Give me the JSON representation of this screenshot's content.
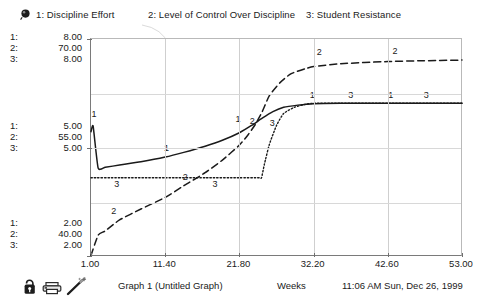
{
  "legend": {
    "pin_icon": "pushpin-icon",
    "items": [
      {
        "key": "1",
        "label": "1: Discipline Effort"
      },
      {
        "key": "2",
        "label": "2: Level of Control Over Discipline"
      },
      {
        "key": "3",
        "label": "3: Student Resistance"
      }
    ]
  },
  "y_axis_blocks": {
    "top": [
      {
        "idx": "1:",
        "val": "8.00"
      },
      {
        "idx": "2:",
        "val": "70.00"
      },
      {
        "idx": "3:",
        "val": "8.00"
      }
    ],
    "middle": [
      {
        "idx": "1:",
        "val": "5.00"
      },
      {
        "idx": "2:",
        "val": "55.00"
      },
      {
        "idx": "3:",
        "val": "5.00"
      }
    ],
    "bottom": [
      {
        "idx": "1:",
        "val": "2.00"
      },
      {
        "idx": "2:",
        "val": "40.00"
      },
      {
        "idx": "3:",
        "val": "2.00"
      }
    ]
  },
  "x_tick_labels": [
    "1.00",
    "11.40",
    "21.80",
    "32.20",
    "42.60",
    "53.00"
  ],
  "footer": {
    "graph_title": "Graph 1 (Untitled Graph)",
    "x_axis_title": "Weeks",
    "timestamp": "11:06 AM Sun, Dec 26, 1999",
    "icons": [
      "lock-icon",
      "printer-icon",
      "wand-icon"
    ]
  },
  "chart_data": {
    "type": "line",
    "title": "Graph 1 (Untitled Graph)",
    "xlabel": "Weeks",
    "ylabel": "",
    "grid": true,
    "legend_position": "top",
    "xlim": [
      1.0,
      53.0
    ],
    "x_ticks": [
      1.0,
      11.4,
      21.8,
      32.2,
      42.6,
      53.0
    ],
    "y_axes": [
      {
        "series": "1: Discipline Effort",
        "ylim": [
          2.0,
          8.0
        ],
        "ticks": [
          2.0,
          5.0,
          8.0
        ]
      },
      {
        "series": "2: Level of Control Over Discipline",
        "ylim": [
          40.0,
          70.0
        ],
        "ticks": [
          40.0,
          55.0,
          70.0
        ]
      },
      {
        "series": "3: Student Resistance",
        "ylim": [
          2.0,
          8.0
        ],
        "ticks": [
          2.0,
          5.0,
          8.0
        ]
      }
    ],
    "series": [
      {
        "name": "1: Discipline Effort",
        "key": "1",
        "style": "solid",
        "axis": 0,
        "x": [
          1.0,
          1.3,
          2.0,
          3.0,
          5.0,
          8.0,
          11.4,
          14.0,
          17.0,
          19.5,
          21.8,
          23.5,
          25.0,
          26.5,
          28.0,
          30.0,
          32.2,
          36.0,
          42.6,
          47.0,
          53.0
        ],
        "y": [
          5.45,
          5.6,
          4.45,
          4.47,
          4.53,
          4.62,
          4.75,
          4.88,
          5.05,
          5.22,
          5.42,
          5.62,
          5.82,
          6.0,
          6.12,
          6.18,
          6.22,
          6.23,
          6.23,
          6.23,
          6.23
        ]
      },
      {
        "name": "2: Level of Control Over Discipline",
        "key": "2",
        "style": "dashed",
        "axis": 1,
        "x": [
          1.0,
          2.0,
          3.0,
          5.0,
          8.0,
          11.4,
          14.0,
          17.0,
          19.5,
          21.8,
          23.0,
          24.0,
          25.0,
          26.0,
          27.5,
          29.0,
          31.0,
          32.2,
          36.0,
          42.6,
          47.0,
          53.0
        ],
        "y": [
          40.2,
          43.0,
          43.6,
          45.1,
          46.6,
          48.2,
          49.8,
          51.6,
          53.4,
          55.4,
          56.8,
          58.2,
          60.0,
          62.2,
          64.0,
          65.2,
          65.9,
          66.2,
          66.6,
          66.9,
          67.0,
          67.1
        ]
      },
      {
        "name": "3: Student Resistance",
        "key": "3",
        "style": "dotted",
        "axis": 2,
        "x": [
          1.0,
          5.0,
          11.4,
          17.0,
          21.8,
          24.6,
          24.9,
          25.3,
          26.0,
          27.0,
          28.0,
          29.5,
          31.0,
          32.2,
          36.0,
          42.6,
          47.0,
          53.0
        ],
        "y": [
          4.18,
          4.18,
          4.18,
          4.18,
          4.18,
          4.18,
          4.18,
          4.55,
          5.1,
          5.62,
          5.95,
          6.12,
          6.2,
          6.23,
          6.23,
          6.23,
          6.23,
          6.23
        ]
      }
    ],
    "inline_point_labels": [
      {
        "series": "1",
        "text": "1",
        "x": 1.4,
        "y": 5.85
      },
      {
        "series": "1",
        "text": "1",
        "x": 11.6,
        "y": 4.92
      },
      {
        "series": "1",
        "text": "1",
        "x": 21.6,
        "y": 5.72
      },
      {
        "series": "1",
        "text": "1",
        "x": 32.0,
        "y": 6.38
      },
      {
        "series": "1",
        "text": "1",
        "x": 43.0,
        "y": 6.38
      },
      {
        "series": "2",
        "text": "2",
        "x": 4.2,
        "y": 45.9
      },
      {
        "series": "2",
        "text": "2",
        "x": 14.2,
        "y": 50.6
      },
      {
        "series": "2",
        "text": "2",
        "x": 23.6,
        "y": 58.3
      },
      {
        "series": "2",
        "text": "2",
        "x": 33.0,
        "y": 67.8
      },
      {
        "series": "2",
        "text": "2",
        "x": 43.6,
        "y": 68.0
      },
      {
        "series": "3",
        "text": "3",
        "x": 4.6,
        "y": 3.94
      },
      {
        "series": "3",
        "text": "3",
        "x": 18.4,
        "y": 3.94
      },
      {
        "series": "3",
        "text": "3",
        "x": 26.4,
        "y": 5.62
      },
      {
        "series": "3",
        "text": "3",
        "x": 37.4,
        "y": 6.38
      },
      {
        "series": "3",
        "text": "3",
        "x": 48.0,
        "y": 6.38
      }
    ]
  }
}
